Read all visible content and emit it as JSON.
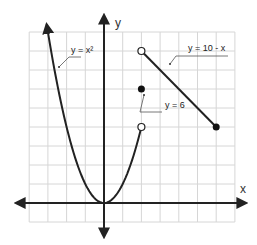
{
  "chart_data": {
    "type": "line",
    "title": "",
    "xlabel": "x",
    "ylabel": "y",
    "xlim": [
      -4,
      7
    ],
    "ylim": [
      -1,
      9
    ],
    "grid": true,
    "unit_px_x": 18.7,
    "unit_px_y": 19,
    "origin_px": [
      104,
      203
    ],
    "series": [
      {
        "name": "y = x²",
        "label": "y = x²",
        "domain": [
          -3.9,
          2
        ],
        "left_end": "arrow",
        "right_end": "open",
        "label_pos": [
          44,
          22
        ],
        "leader": [
          [
            46,
            27
          ],
          [
            38,
            27
          ],
          [
            30,
            36
          ]
        ]
      },
      {
        "name": "y = 6",
        "label": "y = 6",
        "points": [
          [
            2,
            6
          ]
        ],
        "end": "closed",
        "label_pos": [
          126,
          60
        ],
        "leader": [
          [
            148,
            64
          ],
          [
            124,
            64
          ],
          [
            116,
            60
          ]
        ]
      },
      {
        "name": "y = 10 - x",
        "label": "y = 10 - x",
        "x": [
          2,
          6
        ],
        "y": [
          8,
          4
        ],
        "left_end": "open",
        "right_end": "closed",
        "label_pos": [
          168,
          26
        ],
        "leader": [
          [
            228,
            30
          ],
          [
            174,
            30
          ],
          [
            164,
            36
          ]
        ]
      }
    ]
  },
  "axes": {
    "x_label": "x",
    "y_label": "y"
  },
  "labels": {
    "parabola": "y = x²",
    "point": "y = 6",
    "line": "y = 10 - x"
  }
}
